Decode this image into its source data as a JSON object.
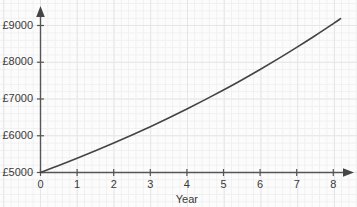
{
  "chart_data": {
    "type": "line",
    "title": "",
    "xlabel": "Year",
    "ylabel": "",
    "xlim": [
      0,
      8.4
    ],
    "ylim": [
      5000,
      9400
    ],
    "grid": true,
    "legend_position": "none",
    "x_ticks": [
      "0",
      "1",
      "2",
      "3",
      "4",
      "5",
      "6",
      "7",
      "8"
    ],
    "x_tick_values": [
      0,
      1,
      2,
      3,
      4,
      5,
      6,
      7,
      8
    ],
    "y_ticks": [
      "£5000",
      "£6000",
      "£7000",
      "£8000",
      "£9000"
    ],
    "y_tick_values": [
      5000,
      6000,
      7000,
      8000,
      9000
    ],
    "series": [
      {
        "name": "Investment value",
        "color": "#444444",
        "x": [
          0,
          0.5,
          1,
          1.5,
          2,
          2.5,
          3,
          3.5,
          4,
          4.5,
          5,
          5.5,
          6,
          6.5,
          7,
          7.5,
          8,
          8.2
        ],
        "values": [
          5000,
          5190,
          5386,
          5590,
          5801,
          6020,
          6247,
          6483,
          6728,
          6982,
          7246,
          7519,
          7803,
          8098,
          8404,
          8721,
          9051,
          9187
        ]
      }
    ],
    "annotations": []
  },
  "axis": {
    "x_arrow": "arrow-right",
    "y_arrow": "arrow-up",
    "axis_color": "#555555"
  }
}
